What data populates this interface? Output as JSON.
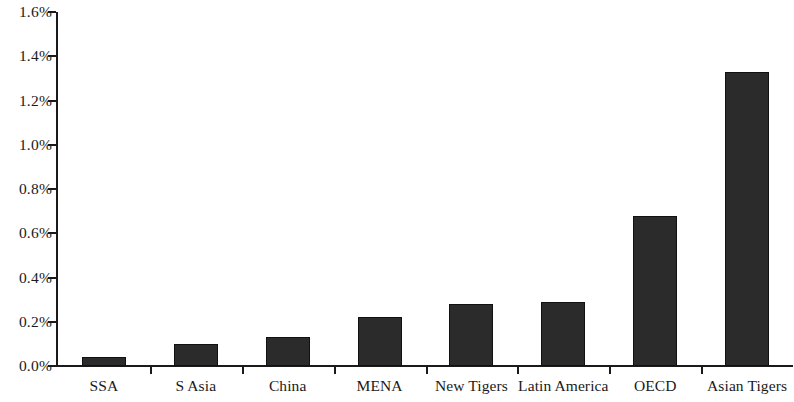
{
  "chart_data": {
    "type": "bar",
    "title": "",
    "subtitle": "",
    "xlabel": "",
    "ylabel": "",
    "grid": false,
    "legend": false,
    "ylim": [
      0,
      0.016
    ],
    "y_tick_labels": [
      "0.0%",
      "0.2%",
      "0.4%",
      "0.6%",
      "0.8%",
      "1.0%",
      "1.2%",
      "1.4%",
      "1.6%"
    ],
    "y_tick_values": [
      0.0,
      0.2,
      0.4,
      0.6,
      0.8,
      1.0,
      1.2,
      1.4,
      1.6
    ],
    "y_axis_max": 1.6,
    "y_axis_min": 0.0,
    "categories": [
      "SSA",
      "S Asia",
      "China",
      "MENA",
      "New Tigers",
      "Latin America",
      "OECD",
      "Asian Tigers"
    ],
    "values": [
      0.04,
      0.1,
      0.13,
      0.22,
      0.28,
      0.29,
      0.68,
      1.33
    ],
    "value_unit": "%",
    "bar_color": "#2b2b2b",
    "axis_color": "#1a1a1a",
    "background_color": "#ffffff"
  }
}
